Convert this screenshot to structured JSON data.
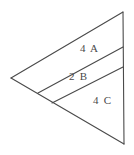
{
  "figure": {
    "background_color": "#ffffff",
    "stroke_color": "#4a4a4a",
    "label_color": "#4a4a4a",
    "width": 134,
    "height": 155,
    "type": "geometry-diagram",
    "outline": {
      "apex_left": [
        11,
        78
      ],
      "vertex_top_right": [
        123,
        12
      ],
      "vertex_bottom_right": [
        124,
        144
      ]
    },
    "dividers": [
      {
        "name": "divider-upper",
        "from": [
          38,
          93
        ],
        "to": [
          123,
          47
        ]
      },
      {
        "name": "divider-lower",
        "from": [
          52,
          103
        ],
        "to": [
          123,
          67
        ]
      }
    ],
    "labels": [
      {
        "id": "region-a",
        "text": "4 A"
      },
      {
        "id": "region-b",
        "text": "2 B"
      },
      {
        "id": "region-c",
        "text": "4 C"
      }
    ]
  }
}
